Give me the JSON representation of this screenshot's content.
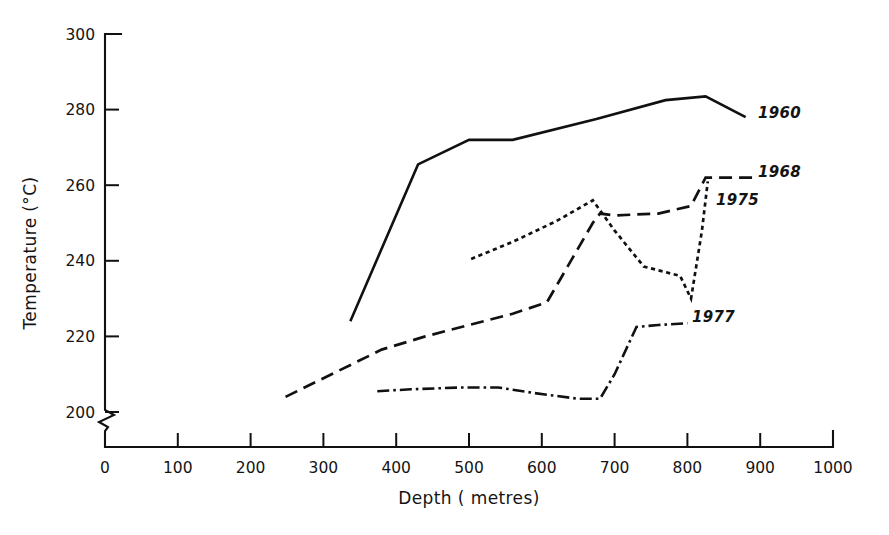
{
  "chart_data": {
    "type": "line",
    "title": "",
    "xlabel": "Depth ( metres)",
    "ylabel": "Temperature (°C)",
    "xlim": [
      0,
      1000
    ],
    "ylim": [
      195,
      300
    ],
    "y_axis_break": true,
    "y_axis_break_note": "axis broken between 0 and 200",
    "grid": false,
    "legend_position": "right-inline-labels",
    "xticks": [
      0,
      100,
      200,
      300,
      400,
      500,
      600,
      700,
      800,
      900,
      1000
    ],
    "xtick_labels": [
      "0",
      "100",
      "200",
      "300",
      "400",
      "500",
      "600",
      "700",
      "800",
      "900",
      "1000"
    ],
    "yticks": [
      200,
      220,
      240,
      260,
      280,
      300
    ],
    "ytick_labels": [
      "200",
      "220",
      "240",
      "260",
      "280",
      "300"
    ],
    "series": [
      {
        "name": "1960",
        "style": "solid",
        "label": "1960",
        "x": [
          337,
          430,
          500,
          560,
          675,
          770,
          825,
          880
        ],
        "y": [
          224,
          265.5,
          272,
          272,
          277.5,
          282.5,
          283.5,
          278
        ]
      },
      {
        "name": "1968",
        "style": "dashed",
        "label": "1968",
        "x": [
          248,
          380,
          440,
          500,
          560,
          607,
          670,
          680,
          700,
          760,
          805,
          825,
          890
        ],
        "y": [
          204,
          216.5,
          220,
          223,
          226,
          229,
          250,
          252.5,
          252,
          252.5,
          254.5,
          262,
          262
        ]
      },
      {
        "name": "1975",
        "style": "dotted",
        "label": "1975",
        "x": [
          503,
          560,
          620,
          670,
          700,
          740,
          790,
          805,
          820,
          828
        ],
        "y": [
          240.5,
          245,
          250.5,
          256,
          248,
          238.5,
          236,
          230,
          248,
          261
        ]
      },
      {
        "name": "1977",
        "style": "dashdot",
        "label": "1977",
        "x": [
          374,
          420,
          490,
          540,
          590,
          650,
          680,
          700,
          730,
          760,
          800
        ],
        "y": [
          205.5,
          206,
          206.5,
          206.5,
          205,
          203.5,
          203.5,
          210,
          222.5,
          223,
          223.5
        ]
      }
    ],
    "series_label_positions": [
      {
        "name": "1960",
        "x_px": 758,
        "y_px": 118
      },
      {
        "name": "1968",
        "x_px": 758,
        "y_px": 177
      },
      {
        "name": "1975",
        "x_px": 716,
        "y_px": 205
      },
      {
        "name": "1977",
        "x_px": 692,
        "y_px": 322
      }
    ],
    "colors": {
      "ink": "#111111",
      "background": "#ffffff"
    }
  }
}
